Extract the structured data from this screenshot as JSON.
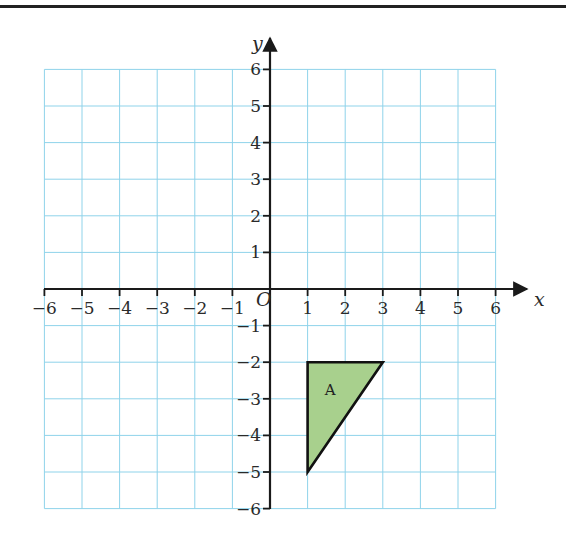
{
  "chart_data": {
    "type": "coordinate-grid",
    "xlabel": "x",
    "ylabel": "y",
    "origin_label": "O",
    "xlim": [
      -6,
      6
    ],
    "ylim": [
      -6,
      6
    ],
    "grid": true,
    "x_ticks": [
      -6,
      -5,
      -4,
      -3,
      -2,
      -1,
      1,
      2,
      3,
      4,
      5,
      6
    ],
    "y_ticks": [
      6,
      5,
      4,
      3,
      2,
      1,
      -1,
      -2,
      -3,
      -4,
      -5,
      -6
    ],
    "x_tick_labels": [
      "−6",
      "−5",
      "−4",
      "−3",
      "−2",
      "−1",
      "1",
      "2",
      "3",
      "4",
      "5",
      "6"
    ],
    "y_tick_labels": [
      "6",
      "5",
      "4",
      "3",
      "2",
      "1",
      "−1",
      "−2",
      "−3",
      "−4",
      "−5",
      "−6"
    ],
    "shapes": [
      {
        "name": "A",
        "type": "triangle",
        "vertices": [
          [
            1,
            -2
          ],
          [
            3,
            -2
          ],
          [
            1,
            -5
          ]
        ],
        "fill": "#a8d08d",
        "stroke": "#111111"
      }
    ]
  },
  "colors": {
    "grid_line": "#8fd3ea",
    "axis": "#1a1a1a",
    "shape_fill": "#a8d08d"
  }
}
